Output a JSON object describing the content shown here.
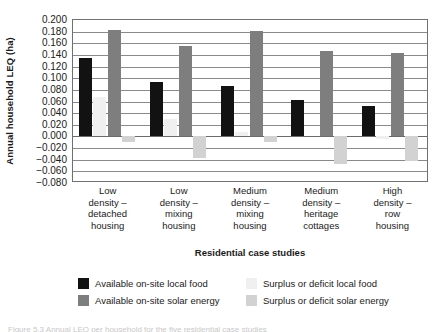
{
  "chart_data": {
    "type": "bar",
    "title": "",
    "xlabel": "Residential case studies",
    "ylabel": "Annual household LEQ (ha)",
    "ylim": [
      -0.08,
      0.2
    ],
    "ytick_labels": [
      "0.200",
      "0.180",
      "0.160",
      "0.140",
      "0.120",
      "0.100",
      "0.080",
      "0.060",
      "0.040",
      "0.020",
      "0.000",
      "−0.020",
      "−0.040",
      "−0.060",
      "−0.080"
    ],
    "ytick_values": [
      0.2,
      0.18,
      0.16,
      0.14,
      0.12,
      0.1,
      0.08,
      0.06,
      0.04,
      0.02,
      0.0,
      -0.02,
      -0.04,
      -0.06,
      -0.08
    ],
    "grid": true,
    "legend_position": "bottom",
    "categories": [
      "Low density – detached housing",
      "Low density – mixing housing",
      "Medium density – mixing housing",
      "Medium density – heritage cottages",
      "High density – row housing"
    ],
    "category_lines": [
      [
        "Low",
        "density –",
        "detached",
        "housing"
      ],
      [
        "Low",
        "density –",
        "mixing",
        "housing"
      ],
      [
        "Medium",
        "density –",
        "mixing",
        "housing"
      ],
      [
        "Medium",
        "density –",
        "heritage",
        "cottages"
      ],
      [
        "High",
        "density –",
        "row",
        "housing"
      ]
    ],
    "series": [
      {
        "name": "Available on-site local food",
        "color": "#121212",
        "values": [
          0.135,
          0.093,
          0.087,
          0.063,
          0.052
        ]
      },
      {
        "name": "Surplus or deficit local food",
        "color": "#f0f0f0",
        "values": [
          0.068,
          0.03,
          0.008,
          0.0,
          -0.004
        ]
      },
      {
        "name": "Available on-site solar energy",
        "color": "#7e7e7e",
        "values": [
          0.182,
          0.155,
          0.181,
          0.146,
          0.143
        ]
      },
      {
        "name": "Surplus or deficit solar energy",
        "color": "#d2d2d2",
        "values": [
          -0.01,
          -0.037,
          -0.01,
          -0.047,
          -0.043
        ]
      }
    ]
  },
  "legend": {
    "items": [
      {
        "label": "Available on-site local food",
        "swatch": "black"
      },
      {
        "label": "Surplus or deficit local food",
        "swatch": "lfood"
      },
      {
        "label": "Available on-site solar energy",
        "swatch": "dgray"
      },
      {
        "label": "Surplus or deficit solar energy",
        "swatch": "lsolar"
      }
    ]
  },
  "caption": "Figure 5.3 Annual LEQ per household for the five residential case studies"
}
